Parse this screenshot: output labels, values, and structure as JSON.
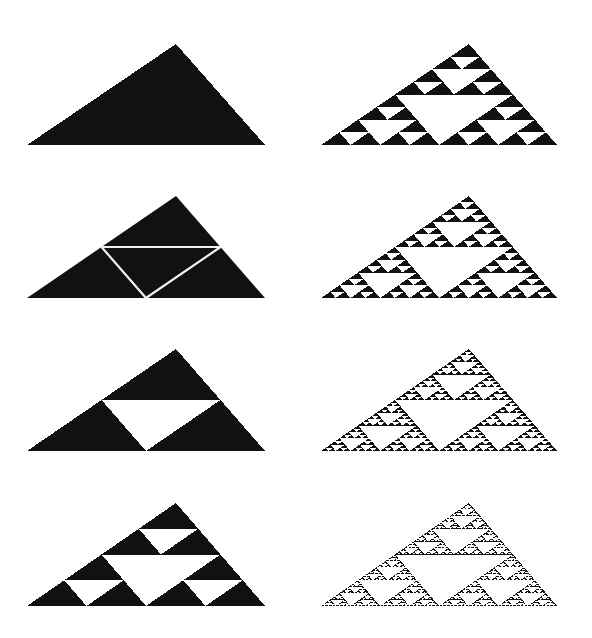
{
  "figure": {
    "fill_color": "#111111",
    "background_color": "#ffffff",
    "line_color": "#f2f2f2",
    "panels": [
      {
        "id": "stage-0",
        "level": 0,
        "mode": "solid",
        "apex": [
          176,
          44
        ],
        "left": [
          27,
          145
        ],
        "right": [
          265,
          145
        ]
      },
      {
        "id": "stage-0-subdivided",
        "level": 1,
        "mode": "outline",
        "apex": [
          176,
          196
        ],
        "left": [
          27,
          298
        ],
        "right": [
          265,
          298
        ]
      },
      {
        "id": "stage-1",
        "level": 1,
        "mode": "solid",
        "apex": [
          176,
          349
        ],
        "left": [
          27,
          451
        ],
        "right": [
          265,
          451
        ]
      },
      {
        "id": "stage-2",
        "level": 2,
        "mode": "solid",
        "apex": [
          176,
          503
        ],
        "left": [
          27,
          606
        ],
        "right": [
          265,
          606
        ]
      },
      {
        "id": "stage-3",
        "level": 3,
        "mode": "solid",
        "apex": [
          469,
          44
        ],
        "left": [
          321,
          145
        ],
        "right": [
          557,
          145
        ]
      },
      {
        "id": "stage-4",
        "level": 4,
        "mode": "solid",
        "apex": [
          469,
          196
        ],
        "left": [
          321,
          298
        ],
        "right": [
          557,
          298
        ]
      },
      {
        "id": "stage-5",
        "level": 5,
        "mode": "solid",
        "apex": [
          469,
          349
        ],
        "left": [
          321,
          451
        ],
        "right": [
          557,
          451
        ]
      },
      {
        "id": "stage-6",
        "level": 6,
        "mode": "solid",
        "apex": [
          469,
          503
        ],
        "left": [
          321,
          606
        ],
        "right": [
          557,
          606
        ]
      }
    ]
  }
}
